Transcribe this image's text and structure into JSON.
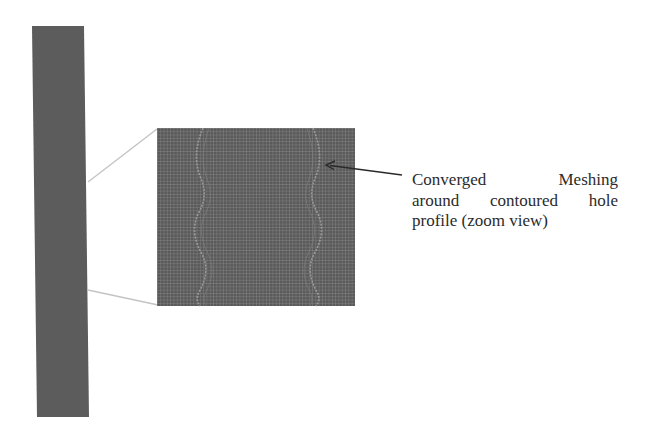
{
  "figure": {
    "colors": {
      "background": "#ffffff",
      "specimen_fill": "#5c5c5c",
      "mesh_fill": "#5a5a5a",
      "mesh_grid_line": "#8a8a8a",
      "mesh_seam": "#9a9a9a",
      "connector_line": "#c4c4c4",
      "arrow": "#2a2a2a",
      "caption_text": "#2b2b2b"
    },
    "specimen": {
      "label": "full specimen strip",
      "top_left": [
        32,
        26
      ],
      "top_right": [
        84,
        26
      ],
      "bottom_right": [
        89,
        417
      ],
      "bottom_left": [
        37,
        417
      ]
    },
    "zoom_view": {
      "label": "meshed region zoom view",
      "x": 157,
      "y": 128,
      "width": 198,
      "height": 178,
      "mesh_cell_px": 3.3
    },
    "connectors": [
      {
        "from": [
          88,
          182
        ],
        "to": [
          157,
          129
        ]
      },
      {
        "from": [
          88,
          290
        ],
        "to": [
          158,
          305
        ]
      }
    ],
    "arrow": {
      "tail": [
        402,
        175
      ],
      "head": [
        326,
        165
      ]
    },
    "caption": {
      "lines": [
        "Converged Meshing",
        "around contoured hole",
        "profile (zoom view)"
      ]
    }
  }
}
